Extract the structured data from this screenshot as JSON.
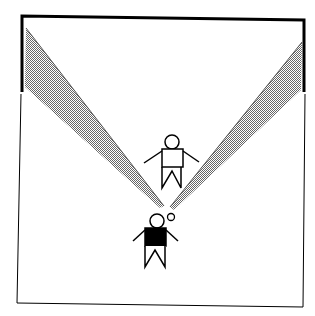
{
  "diagram": {
    "elements": [
      {
        "name": "room-outline"
      },
      {
        "name": "back-wall",
        "style": "thick"
      },
      {
        "name": "sight-cone-left",
        "fill": "hatched-gray"
      },
      {
        "name": "sight-cone-right",
        "fill": "hatched-gray"
      },
      {
        "name": "figure-standing",
        "shirt": "white"
      },
      {
        "name": "figure-viewer",
        "shirt": "black"
      },
      {
        "name": "eye-point"
      }
    ],
    "colors": {
      "line": "#000000",
      "hatch": "#888888",
      "background": "#ffffff"
    }
  }
}
